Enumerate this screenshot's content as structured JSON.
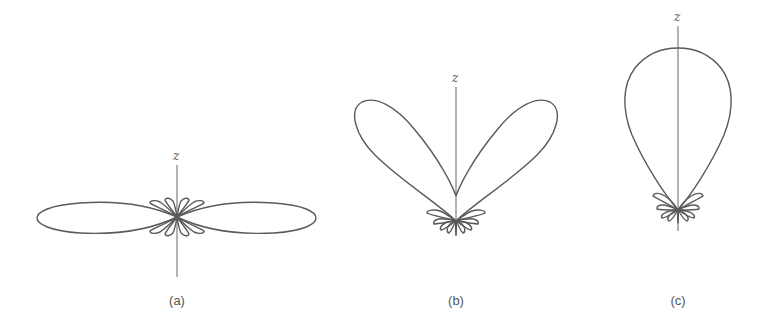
{
  "figure": {
    "panels": [
      {
        "id": "a",
        "caption": "(a)",
        "axis_label": "z",
        "description": "Broadside radiation pattern: two large horizontal main lobes with several small side lobes near origin",
        "origin": [
          177,
          217
        ],
        "axis_top": 165,
        "axis_bottom": 277,
        "label_y": 159
      },
      {
        "id": "b",
        "caption": "(b)",
        "axis_label": "z",
        "description": "Two main lobes tilted upward forming a V shape with small side lobes below origin",
        "origin": [
          456,
          221
        ],
        "axis_top": 87,
        "axis_bottom": 236,
        "label_y": 80
      },
      {
        "id": "c",
        "caption": "(c)",
        "axis_label": "z",
        "description": "End-fire pattern: single large main lobe along +z axis with small side lobes near origin",
        "origin": [
          678,
          210
        ],
        "axis_top": 26,
        "axis_bottom": 231,
        "label_y": 21
      }
    ],
    "colors": {
      "stroke": "#5a5a5a",
      "axis": "#666666",
      "text": "#555555"
    }
  }
}
